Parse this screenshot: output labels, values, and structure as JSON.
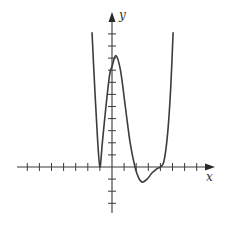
{
  "chart_data": {
    "type": "line",
    "title": "",
    "xlabel": "x",
    "ylabel": "y",
    "grid": false,
    "legend": null,
    "tick_labels": "none (unlabeled unit ticks)",
    "x_ticks": [
      -7,
      -6,
      -5,
      -4,
      -3,
      -2,
      -1,
      1,
      2,
      3,
      4,
      5,
      6,
      7
    ],
    "y_ticks": [
      -3,
      -2,
      -1,
      1,
      2,
      3,
      4,
      5,
      6,
      7,
      8,
      9,
      10,
      11
    ],
    "xlim": [
      -7.8,
      8.4
    ],
    "ylim": [
      -3.8,
      12.6
    ],
    "series": [
      {
        "name": "f(x)",
        "x": [
          -1.65,
          -1.4,
          -1.2,
          -1.0,
          -0.8,
          -0.5,
          -0.2,
          0.0,
          0.33,
          0.7,
          1.1,
          1.5,
          1.9,
          2.2,
          2.5,
          2.9,
          3.3,
          3.7,
          4.0,
          4.3,
          4.6,
          4.85,
          5.05
        ],
        "y": [
          11.1,
          6.0,
          2.4,
          0.0,
          2.0,
          5.0,
          7.6,
          8.3,
          9.2,
          8.0,
          5.0,
          2.0,
          0.0,
          -0.9,
          -1.25,
          -1.0,
          -0.5,
          -0.15,
          0.0,
          0.5,
          2.8,
          6.5,
          11.1
        ]
      }
    ],
    "features": {
      "double_root": -1,
      "local_max": [
        0.33,
        9.2
      ],
      "root": 1.9,
      "local_min": [
        2.5,
        -1.25
      ],
      "inflection_root": 4
    }
  },
  "labels": {
    "x_axis": "x",
    "y_axis": "y"
  },
  "colors": {
    "curve": "#3c3c3c",
    "axis": "#3a3a3a",
    "background": "#ffffff"
  }
}
